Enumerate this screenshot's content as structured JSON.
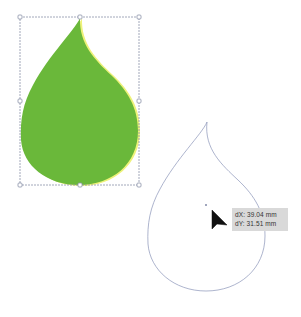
{
  "canvas": {
    "background": "#ffffff"
  },
  "shapes": {
    "filled_drop": {
      "fill_color": "#6ab83a",
      "fringe_color": "#f2f58a",
      "selected": true
    },
    "outline_drop": {
      "stroke_color": "#8a93b8"
    }
  },
  "selection": {
    "bbox_color": "#8c93a8",
    "handle_count": 8
  },
  "cursor": {
    "icon": "arrow-cursor-icon"
  },
  "tooltip": {
    "dx_label": "dX: 39.04 mm",
    "dy_label": "dY: 31.51 mm"
  }
}
